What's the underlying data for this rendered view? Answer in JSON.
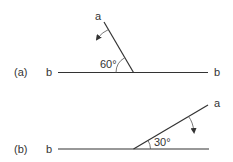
{
  "diagram": {
    "colors": {
      "ink": "#333333",
      "background": "#ffffff"
    },
    "panels": [
      {
        "id": "a",
        "label": "(a)",
        "line_b_left_label": "b",
        "line_b_right_label": "b",
        "line_a_label": "a",
        "angle_label": "60°",
        "rotation_direction": "counterclockwise"
      },
      {
        "id": "b",
        "label": "(b)",
        "line_b_left_label": "b",
        "line_a_label": "a",
        "angle_label": "30°",
        "rotation_direction": "clockwise"
      }
    ]
  }
}
